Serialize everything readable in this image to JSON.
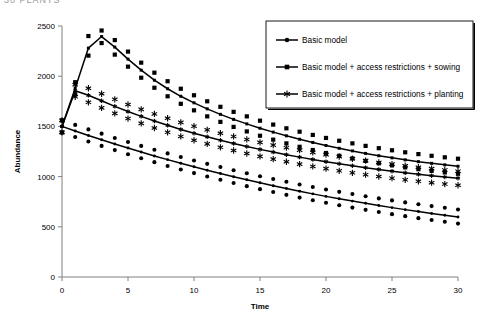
{
  "header": {
    "cropped_text": "30   PLANTS"
  },
  "chart_data": {
    "type": "scatter",
    "title": "",
    "xlabel": "Time",
    "ylabel": "Abundance",
    "xlim": [
      0,
      30
    ],
    "ylim": [
      0,
      2500
    ],
    "xticks": [
      0,
      5,
      10,
      15,
      20,
      25,
      30
    ],
    "yticks": [
      0,
      500,
      1000,
      1500,
      2000,
      2500
    ],
    "grid": false,
    "legend_position": "top-right",
    "line_color": "#000000",
    "series": [
      {
        "name": "Basic model",
        "marker": "diamond",
        "x": [
          0,
          1,
          2,
          3,
          4,
          5,
          6,
          7,
          8,
          9,
          10,
          11,
          12,
          13,
          14,
          15,
          16,
          17,
          18,
          19,
          20,
          21,
          22,
          23,
          24,
          25,
          26,
          27,
          28,
          29,
          30
        ],
        "fit": [
          1500,
          1455,
          1410,
          1367,
          1325,
          1284,
          1245,
          1206,
          1169,
          1133,
          1098,
          1064,
          1031,
          999,
          968,
          938,
          909,
          881,
          854,
          828,
          803,
          779,
          756,
          734,
          712,
          691,
          671,
          652,
          633,
          615,
          598
        ],
        "scatter_upper": [
          1560,
          1515,
          1470,
          1428,
          1385,
          1345,
          1306,
          1268,
          1231,
          1195,
          1160,
          1127,
          1095,
          1063,
          1033,
          1004,
          976,
          948,
          922,
          896,
          872,
          848,
          826,
          804,
          783,
          763,
          743,
          724,
          706,
          689,
          672
        ],
        "scatter_lower": [
          1440,
          1395,
          1350,
          1306,
          1264,
          1222,
          1183,
          1144,
          1106,
          1070,
          1035,
          1001,
          968,
          936,
          905,
          875,
          846,
          818,
          791,
          765,
          739,
          715,
          691,
          669,
          647,
          626,
          606,
          586,
          568,
          550,
          532
        ]
      },
      {
        "name": "Basic model + access restrictions + sowing",
        "marker": "square",
        "x": [
          0,
          1,
          2,
          3,
          4,
          5,
          6,
          7,
          8,
          9,
          10,
          11,
          12,
          13,
          14,
          15,
          16,
          17,
          18,
          19,
          20,
          21,
          22,
          23,
          24,
          25,
          26,
          27,
          28,
          29,
          30
        ],
        "fit": [
          1500,
          1880,
          2280,
          2395,
          2290,
          2170,
          2060,
          1960,
          1875,
          1800,
          1735,
          1675,
          1620,
          1570,
          1525,
          1482,
          1443,
          1406,
          1372,
          1340,
          1310,
          1282,
          1256,
          1231,
          1208,
          1187,
          1167,
          1149,
          1132,
          1117,
          1103
        ],
        "scatter_upper": [
          1560,
          1940,
          2400,
          2455,
          2360,
          2245,
          2135,
          2035,
          1950,
          1875,
          1810,
          1750,
          1695,
          1645,
          1600,
          1557,
          1518,
          1481,
          1447,
          1415,
          1385,
          1357,
          1331,
          1306,
          1283,
          1262,
          1242,
          1224,
          1207,
          1192,
          1178
        ],
        "scatter_lower": [
          1440,
          1820,
          2205,
          2330,
          2215,
          2095,
          1985,
          1885,
          1800,
          1725,
          1660,
          1600,
          1545,
          1495,
          1450,
          1407,
          1368,
          1331,
          1297,
          1265,
          1235,
          1207,
          1181,
          1156,
          1133,
          1112,
          1092,
          1074,
          1057,
          1042,
          1028
        ]
      },
      {
        "name": "Basic model + access restrictions + planting",
        "marker": "asterisk",
        "x": [
          0,
          1,
          2,
          3,
          4,
          5,
          6,
          7,
          8,
          9,
          10,
          11,
          12,
          13,
          14,
          15,
          16,
          17,
          18,
          19,
          20,
          21,
          22,
          23,
          24,
          25,
          26,
          27,
          28,
          29,
          30
        ],
        "fit": [
          1500,
          1855,
          1810,
          1755,
          1700,
          1648,
          1600,
          1554,
          1511,
          1470,
          1432,
          1396,
          1362,
          1330,
          1300,
          1271,
          1244,
          1218,
          1194,
          1171,
          1149,
          1128,
          1108,
          1089,
          1071,
          1054,
          1038,
          1023,
          1009,
          996,
          984
        ],
        "scatter_upper": [
          1560,
          1915,
          1880,
          1825,
          1770,
          1718,
          1670,
          1624,
          1581,
          1540,
          1502,
          1466,
          1432,
          1400,
          1370,
          1341,
          1314,
          1288,
          1264,
          1241,
          1219,
          1198,
          1178,
          1159,
          1141,
          1124,
          1108,
          1093,
          1079,
          1066,
          1054
        ],
        "scatter_lower": [
          1440,
          1795,
          1740,
          1685,
          1630,
          1578,
          1530,
          1484,
          1441,
          1400,
          1362,
          1326,
          1292,
          1260,
          1230,
          1201,
          1174,
          1148,
          1124,
          1101,
          1079,
          1058,
          1038,
          1019,
          1001,
          984,
          968,
          953,
          939,
          926,
          914
        ]
      }
    ]
  },
  "legend": {
    "items": [
      {
        "label": "Basic model",
        "marker": "diamond"
      },
      {
        "label": "Basic model + access restrictions + sowing",
        "marker": "square"
      },
      {
        "label": "Basic model + access restrictions + planting",
        "marker": "asterisk"
      }
    ]
  }
}
